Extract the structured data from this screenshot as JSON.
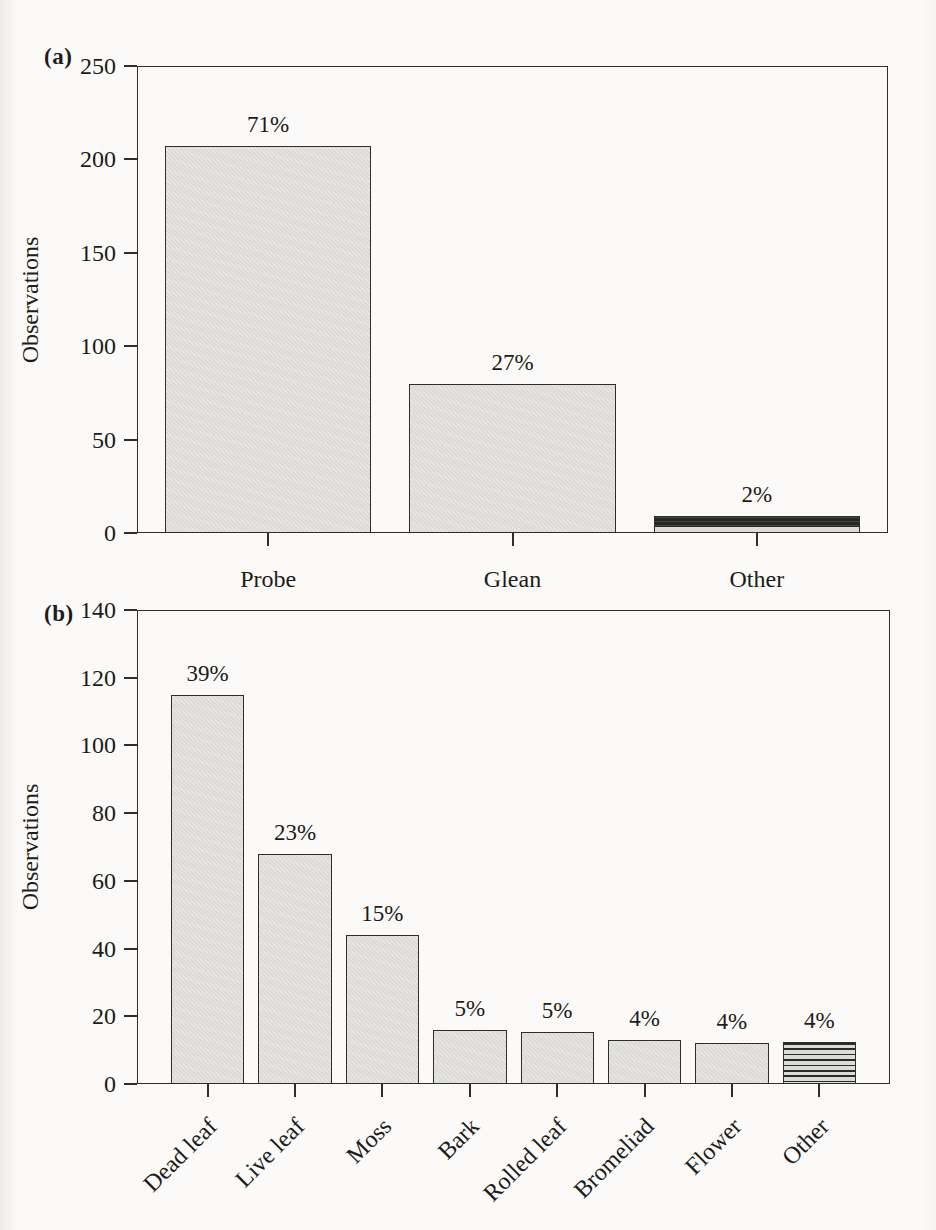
{
  "figure": {
    "description_labels": {
      "panel_a": "(a)",
      "panel_b": "(b)"
    }
  },
  "colors": {
    "paper": "#fbfaf8",
    "ink": "#1c1c1a",
    "axis_line": "#3a3a38",
    "bar_fill": "#dcdbd7",
    "bar_border": "#2e2e2c",
    "dark_bar": "#262624",
    "stripe_dark": "#2c2c2a"
  },
  "chart_data": [
    {
      "type": "bar",
      "panel_label": "(a)",
      "title": "",
      "xlabel": "",
      "ylabel": "Observations",
      "ylim": [
        0,
        250
      ],
      "yticks": [
        0,
        50,
        100,
        150,
        200,
        250
      ],
      "grid": false,
      "legend": "none",
      "categories": [
        "Probe",
        "Glean",
        "Other"
      ],
      "values": [
        207,
        80,
        9
      ],
      "bar_labels": [
        "71%",
        "27%",
        "2%"
      ],
      "bar_styles": [
        "plain",
        "plain",
        "dark-striped"
      ],
      "x_label_rotation": 0
    },
    {
      "type": "bar",
      "panel_label": "(b)",
      "title": "",
      "xlabel": "",
      "ylabel": "Observations",
      "ylim": [
        0,
        140
      ],
      "yticks": [
        0,
        20,
        40,
        60,
        80,
        100,
        120,
        140
      ],
      "grid": false,
      "legend": "none",
      "categories": [
        "Dead leaf",
        "Live leaf",
        "Moss",
        "Bark",
        "Rolled leaf",
        "Bromeliad",
        "Flower",
        "Other"
      ],
      "values": [
        115,
        68,
        44,
        16,
        15.5,
        13,
        12,
        12.5
      ],
      "bar_labels": [
        "39%",
        "23%",
        "15%",
        "5%",
        "5%",
        "4%",
        "4%",
        "4%"
      ],
      "bar_styles": [
        "plain",
        "plain",
        "plain",
        "plain",
        "plain",
        "plain",
        "plain",
        "light-striped"
      ],
      "x_label_rotation": 45
    }
  ]
}
